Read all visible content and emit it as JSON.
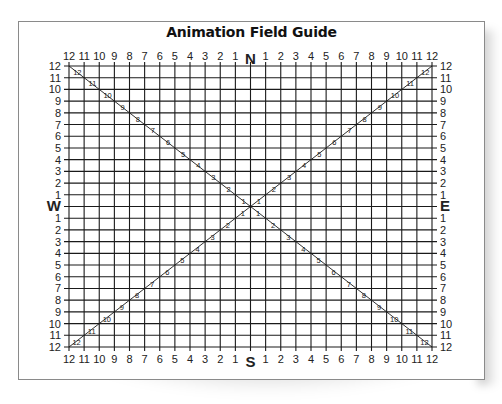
{
  "title": "Animation Field Guide",
  "compass": {
    "north": "N",
    "south": "S",
    "west": "W",
    "east": "E"
  },
  "field_numbers": 12,
  "top_labels": [
    "12",
    "11",
    "10",
    "9",
    "8",
    "7",
    "6",
    "5",
    "4",
    "3",
    "2",
    "1",
    "N",
    "1",
    "2",
    "3",
    "4",
    "5",
    "6",
    "7",
    "8",
    "9",
    "10",
    "11",
    "12"
  ],
  "bottom_labels": [
    "12",
    "11",
    "10",
    "9",
    "8",
    "7",
    "6",
    "5",
    "4",
    "3",
    "2",
    "1",
    "S",
    "1",
    "2",
    "3",
    "4",
    "5",
    "6",
    "7",
    "8",
    "9",
    "10",
    "11",
    "12"
  ],
  "left_labels": [
    "12",
    "11",
    "10",
    "9",
    "8",
    "7",
    "6",
    "5",
    "4",
    "3",
    "2",
    "1",
    "W",
    "1",
    "2",
    "3",
    "4",
    "5",
    "6",
    "7",
    "8",
    "9",
    "10",
    "11",
    "12"
  ],
  "right_labels": [
    "12",
    "11",
    "10",
    "9",
    "8",
    "7",
    "6",
    "5",
    "4",
    "3",
    "2",
    "1",
    "E",
    "1",
    "2",
    "3",
    "4",
    "5",
    "6",
    "7",
    "8",
    "9",
    "10",
    "11",
    "12"
  ],
  "diagonal_labels": [
    "1",
    "2",
    "3",
    "4",
    "5",
    "6",
    "7",
    "8",
    "9",
    "10",
    "11",
    "12"
  ],
  "colors": {
    "grid": "#1a1a1a",
    "text": "#222222",
    "border": "#8a8a8a",
    "background": "#ffffff"
  }
}
